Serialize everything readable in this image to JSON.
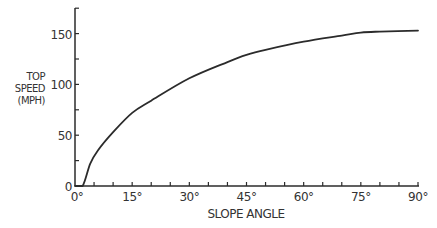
{
  "chart_data": {
    "type": "line",
    "title": "",
    "xlabel": "SLOPE ANGLE",
    "ylabel": [
      "TOP",
      "SPEED",
      "(MPH)"
    ],
    "xlim": [
      0,
      90
    ],
    "ylim": [
      0,
      175
    ],
    "x_ticks": [
      "0°",
      "15°",
      "30°",
      "45°",
      "60°",
      "75°",
      "90°"
    ],
    "x_tick_values": [
      0,
      15,
      30,
      45,
      60,
      75,
      90
    ],
    "y_ticks": [
      "0",
      "50",
      "100",
      "150"
    ],
    "y_tick_values": [
      0,
      50,
      100,
      150
    ],
    "grid": false,
    "legend": null,
    "series": [
      {
        "name": "Top speed",
        "x": [
          0,
          2,
          4,
          6,
          10,
          15,
          20,
          30,
          40,
          45,
          50,
          60,
          70,
          75,
          80,
          90
        ],
        "values": [
          0,
          0,
          22,
          35,
          53,
          72,
          84,
          106,
          122,
          129,
          134,
          142,
          148,
          151,
          152,
          153
        ]
      }
    ]
  }
}
